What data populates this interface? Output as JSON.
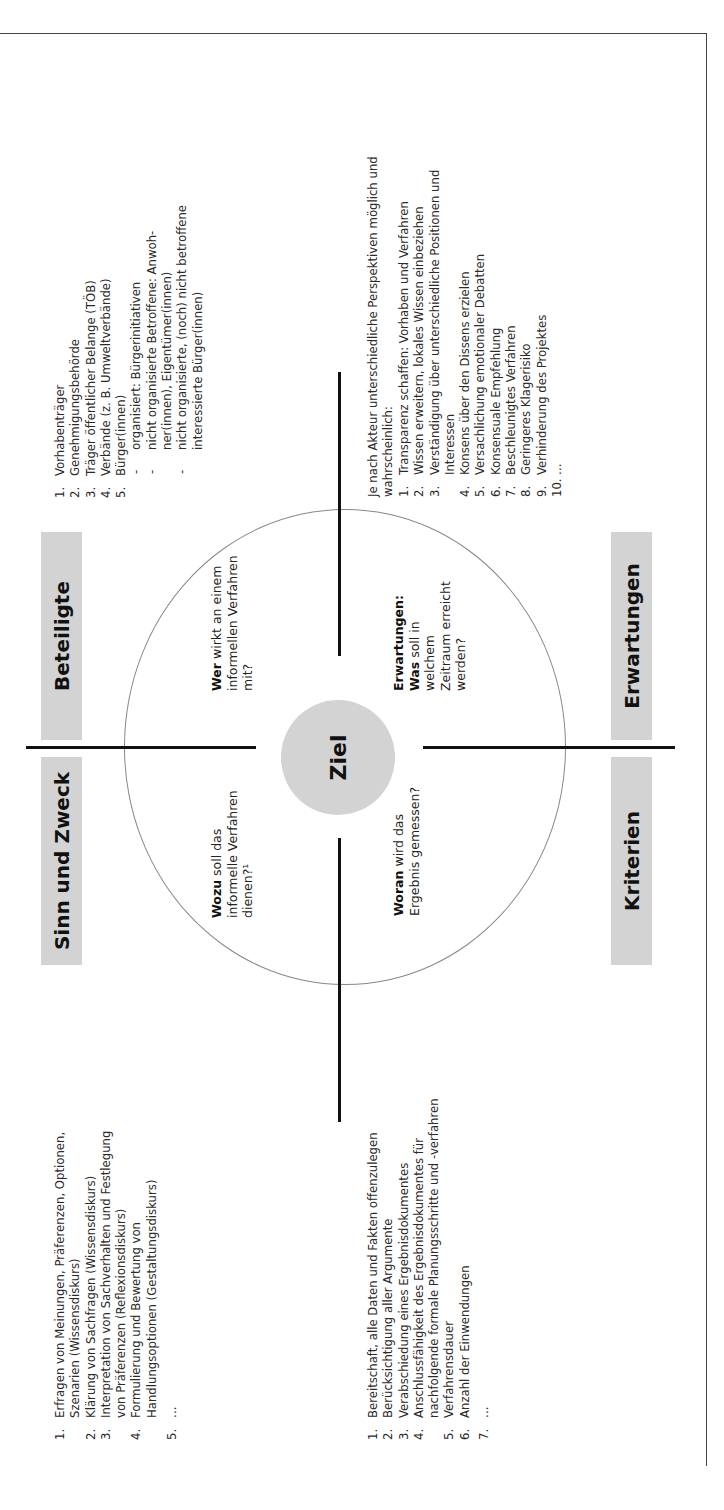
{
  "center": {
    "label": "Ziel"
  },
  "quadrants": {
    "sinn": {
      "title": "Sinn und Zweck",
      "question_bold": "Wozu",
      "question_rest": " soll das informelle Verfahren dienen?¹",
      "items": [
        {
          "num": "1.",
          "text": "Erfragen von Meinungen, Präferenzen, Optionen, Szenarien (Wissensdiskurs)"
        },
        {
          "num": "2.",
          "text": "Klärung von Sachfragen (Wissensdiskurs)"
        },
        {
          "num": "3.",
          "text": "Interpretation von Sachverhalten und Festlegung von Präferenzen (Reflexionsdiskurs)"
        },
        {
          "num": "4.",
          "text": "Formulierung und Bewertung von Handlungsoptionen (Gestaltungsdiskurs)"
        },
        {
          "num": "5.",
          "text": "…"
        }
      ]
    },
    "beteiligte": {
      "title": "Beteiligte",
      "question_bold": "Wer",
      "question_rest": " wirkt an einem informellen Verfahren mit?",
      "items": [
        {
          "num": "1.",
          "text": "Vorhabenträger"
        },
        {
          "num": "2.",
          "text": "Genehmigungsbehörde"
        },
        {
          "num": "3.",
          "text": "Träger öffentlicher Belange (TÖB)"
        },
        {
          "num": "4.",
          "text": "Verbände (z. B. Umweltverbände)"
        },
        {
          "num": "5.",
          "text": "Bürger(innen)"
        }
      ],
      "subitems": [
        {
          "dash": "-",
          "text": "organisiert: Bürgerinitiativen"
        },
        {
          "dash": "-",
          "text": "nicht organisierte Betroffene: Anwoh-ner(innen), Eigentümer(innen)"
        },
        {
          "dash": "-",
          "text": "nicht organisierte, (noch) nicht betroffene interessierte Bürger(innen)"
        }
      ]
    },
    "kriterien": {
      "title": "Kriterien",
      "question_bold": "Woran",
      "question_rest": " wird das Ergebnis gemessen?",
      "items": [
        {
          "num": "1.",
          "text": "Bereitschaft, alle Daten und Fakten offenzulegen"
        },
        {
          "num": "2.",
          "text": "Berücksichtigung aller Argumente"
        },
        {
          "num": "3.",
          "text": "Verabschiedung eines Ergebnisdokumentes"
        },
        {
          "num": "4.",
          "text": "Anschlussfähigkeit des Ergebnisdokumentes für nachfolgende formale Planungsschritte und -verfahren"
        },
        {
          "num": "5.",
          "text": "Verfahrensdauer"
        },
        {
          "num": "6.",
          "text": "Anzahl der Einwendungen"
        },
        {
          "num": "7.",
          "text": "…"
        }
      ]
    },
    "erwartungen": {
      "title": "Erwartungen",
      "question_label": "Erwartungen:",
      "question_bold": "Was",
      "question_rest": " soll in welchem Zeitraum erreicht werden?",
      "intro": "Je nach Akteur unterschiedliche Perspektiven möglich und wahrscheinlich:",
      "items": [
        {
          "num": "1.",
          "text": "Transparenz schaffen: Vorhaben und Verfahren"
        },
        {
          "num": "2.",
          "text": "Wissen erweitern, lokales Wissen einbeziehen"
        },
        {
          "num": "3.",
          "text": "Verständigung über unterschiedliche Positionen und Interessen"
        },
        {
          "num": "4.",
          "text": "Konsens über den Dissens erzielen"
        },
        {
          "num": "5.",
          "text": "Versachlichung emotionaler Debatten"
        },
        {
          "num": "6.",
          "text": "Konsensuale Empfehlung"
        },
        {
          "num": "7.",
          "text": "Beschleunigtes Verfahren"
        },
        {
          "num": "8.",
          "text": "Geringeres Klagerisiko"
        },
        {
          "num": "9.",
          "text": "Verhinderung des Projektes"
        },
        {
          "num": "10.",
          "text": "…"
        }
      ]
    }
  },
  "colors": {
    "box_fill": "#d3d3d3",
    "line": "#111111",
    "circle": "#888888"
  }
}
